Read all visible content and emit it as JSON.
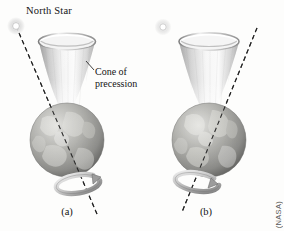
{
  "figure": {
    "title_alt": "Earth's axial precession",
    "background_color": "#fdfdfc",
    "ink_color": "#141414"
  },
  "labels": {
    "north_star": "North Star",
    "cone_line1": "Cone of",
    "cone_line2": "precession",
    "caption_a": "(a)",
    "caption_b": "(b)",
    "credit": "(NASA)"
  },
  "icons": {
    "star": "star-glow-icon",
    "cone": "precession-cone-icon",
    "earth": "earth-globe-icon",
    "axis": "dashed-rotation-axis-icon",
    "spin_arrow": "rotation-arrow-ring-icon",
    "leader": "leader-line-icon"
  },
  "panels": [
    {
      "id": "a",
      "caption": "(a)",
      "axis_tilt_deg": -11,
      "star_visible": true,
      "star_on_axis": true,
      "cone_label_visible": true
    },
    {
      "id": "b",
      "caption": "(b)",
      "axis_tilt_deg": 11,
      "star_visible": true,
      "star_on_axis": false,
      "cone_label_visible": false
    }
  ],
  "colors": {
    "cone_light": "#fefefe",
    "cone_mid": "#d8d8d8",
    "cone_dark": "#9a9a9a",
    "cone_rim": "#8d8d8d",
    "earth_light": "#d9d9d6",
    "earth_mid": "#a9a9a6",
    "earth_dark": "#6f6f6d",
    "axis_dash": "#2e2e2e",
    "arrow_light": "#efefef",
    "arrow_mid": "#b4b4b4",
    "arrow_dark": "#787878",
    "star_core": "#ffffff",
    "star_halo": "#cfcfcf"
  }
}
